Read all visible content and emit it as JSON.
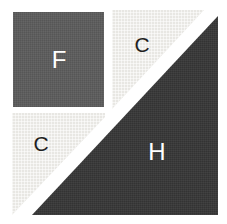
{
  "figure": {
    "background_color": "#ffffff",
    "shapes": [
      {
        "name": "square-f",
        "label": "F",
        "fill_color": "#5d5d5d",
        "label_color": "#ffffff"
      },
      {
        "name": "triangle-c-top-right",
        "label": "C",
        "fill_color": "#e8e7e3",
        "label_color": "#1f1f1f"
      },
      {
        "name": "triangle-c-bottom-left",
        "label": "C",
        "fill_color": "#e8e7e3",
        "label_color": "#1f1f1f"
      },
      {
        "name": "triangle-h",
        "label": "H",
        "fill_color": "#3a3a3a",
        "label_color": "#ffffff"
      }
    ]
  }
}
